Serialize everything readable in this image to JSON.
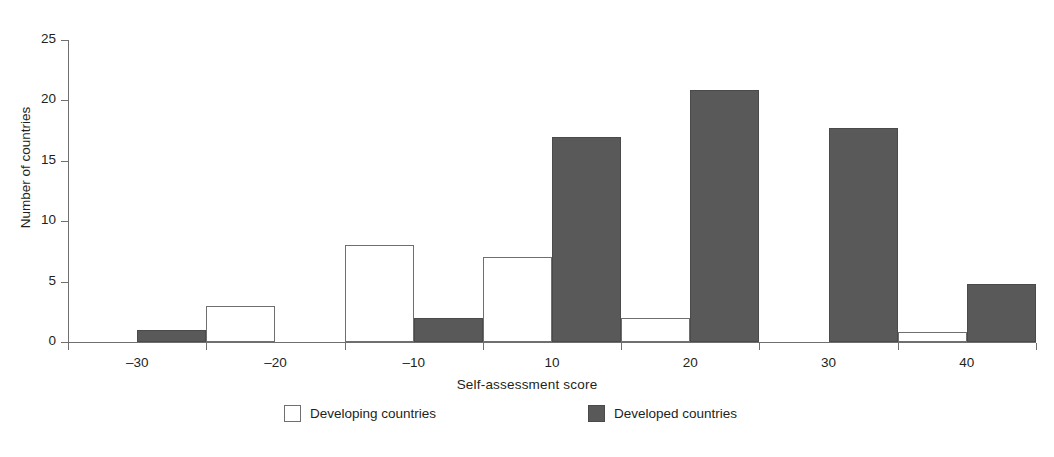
{
  "chart_data": {
    "type": "bar",
    "title": "",
    "subtitle": "",
    "xlabel": "Self-assessment score",
    "ylabel": "Number of countries",
    "categories": [
      "-30",
      "-20",
      "-10",
      "10",
      "20",
      "30",
      "40"
    ],
    "tick_labels_x": [
      "–30",
      "–20",
      "–10",
      "10",
      "20",
      "30",
      "40"
    ],
    "tick_labels_y": [
      "0",
      "5",
      "10",
      "15",
      "20",
      "25"
    ],
    "ylim": [
      0,
      25
    ],
    "ytick_step": 5,
    "grid": false,
    "legend_position": "bottom",
    "series": [
      {
        "name": "Developing countries",
        "color": "#ffffff",
        "edge_color": "#6f6f6f",
        "values": [
          0,
          3,
          8,
          7,
          2,
          0,
          0.8
        ]
      },
      {
        "name": "Developed countries",
        "color": "#595959",
        "edge_color": "#4a4a4a",
        "values": [
          1,
          0,
          2,
          17,
          20.9,
          17.7,
          4.8
        ]
      }
    ]
  },
  "axes": {
    "y_title": "Number of countries",
    "x_title": "Self-assessment score"
  },
  "legend": {
    "items": [
      {
        "label": "Developing countries",
        "swatch": "white-square"
      },
      {
        "label": "Developed countries",
        "swatch": "gray-square"
      }
    ]
  }
}
